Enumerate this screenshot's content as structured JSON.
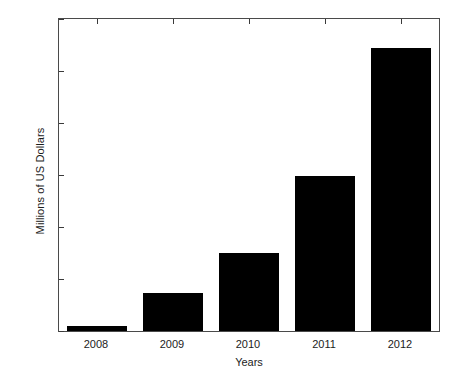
{
  "chart_data": {
    "type": "bar",
    "title": "",
    "xlabel": "Years",
    "ylabel": "Millions of US Dollars",
    "categories": [
      "2008",
      "2009",
      "2010",
      "2011",
      "2012"
    ],
    "values": [
      20,
      145,
      300,
      595,
      1090
    ],
    "ylim": [
      0,
      1200
    ],
    "yticks": [
      0,
      200,
      400,
      600,
      800,
      1000,
      1200
    ],
    "ytick_labels": [
      "0",
      "200",
      "400",
      "600",
      "800",
      "1000",
      "1200"
    ],
    "grid": false,
    "legend": null,
    "bar_color": "#000000",
    "axis_color": "#4a4a4a"
  }
}
